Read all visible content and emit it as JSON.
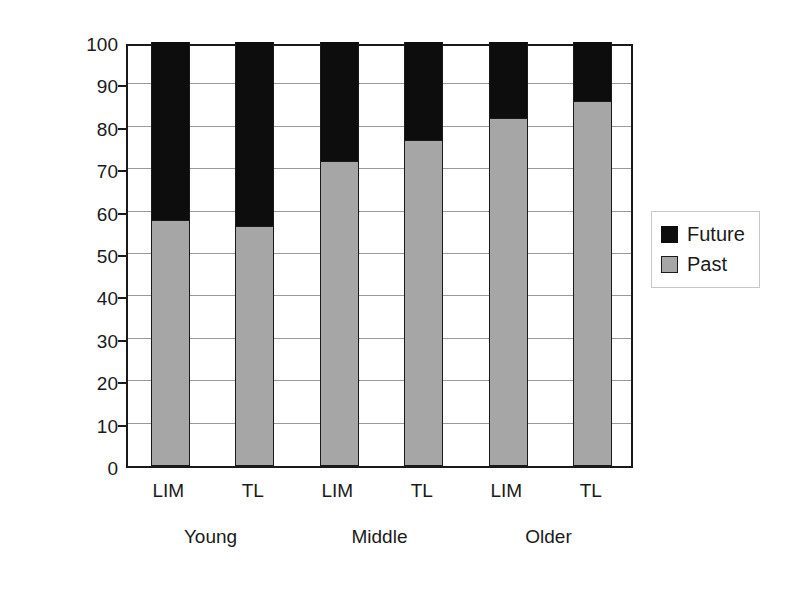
{
  "chart_data": {
    "type": "bar",
    "subtype": "stacked-bar-100",
    "title": "",
    "xlabel": "",
    "ylabel": "Percent of events",
    "ylim": [
      0,
      100
    ],
    "ytick_step": 10,
    "yticks": [
      "100",
      "90",
      "80",
      "70",
      "60",
      "50",
      "40",
      "30",
      "20",
      "10",
      "0"
    ],
    "grid": true,
    "legend_position": "right",
    "categories": [
      "LIM",
      "TL",
      "LIM",
      "TL",
      "LIM",
      "TL"
    ],
    "groups": [
      {
        "label": "Young",
        "categories": [
          "LIM",
          "TL"
        ]
      },
      {
        "label": "Middle",
        "categories": [
          "LIM",
          "TL"
        ]
      },
      {
        "label": "Older",
        "categories": [
          "LIM",
          "TL"
        ]
      }
    ],
    "series": [
      {
        "name": "Past",
        "color": "#a6a6a6",
        "values": [
          58,
          56.5,
          72,
          77,
          82,
          86
        ]
      },
      {
        "name": "Future",
        "color": "#0d0d0d",
        "values": [
          42,
          43.5,
          28,
          23,
          18,
          14
        ]
      }
    ]
  },
  "axes": {
    "y_title": "Percent of events"
  },
  "legend": {
    "entries": [
      {
        "label": "Future",
        "swatch": "future-swatch",
        "color": "#0d0d0d"
      },
      {
        "label": "Past",
        "swatch": "past-swatch",
        "color": "#a6a6a6"
      }
    ]
  }
}
